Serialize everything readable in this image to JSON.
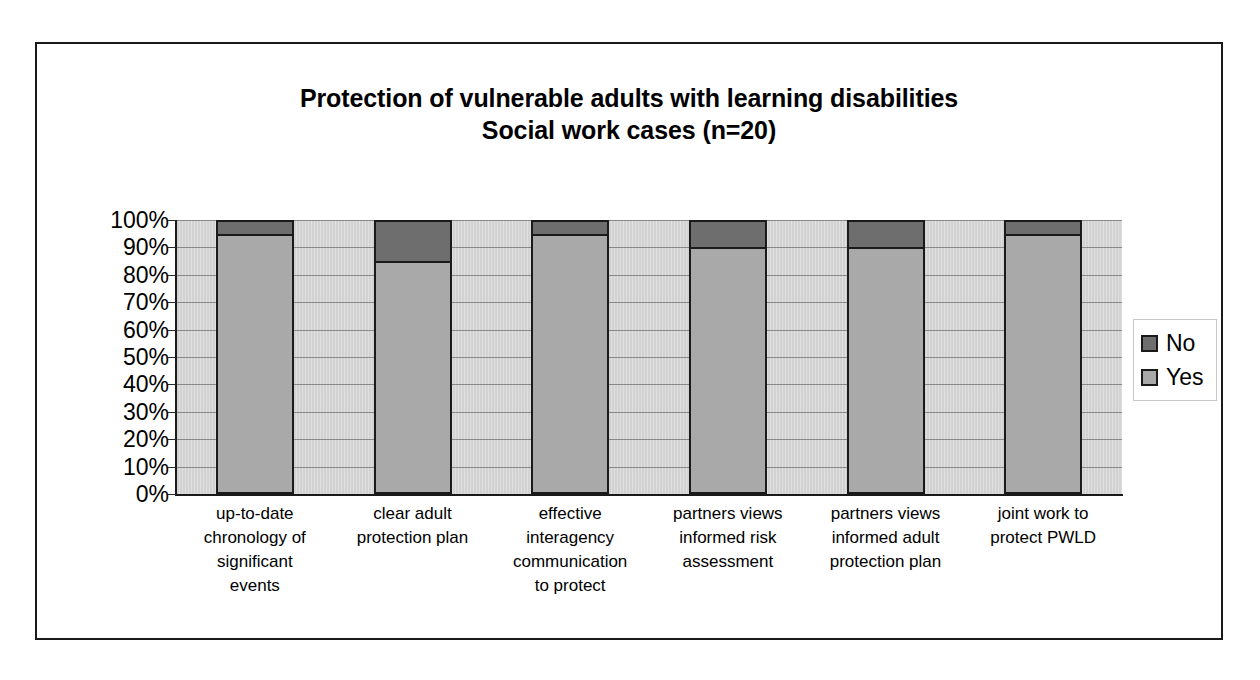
{
  "chart_data": {
    "type": "bar",
    "subtype": "100% stacked column",
    "title": "Protection of vulnerable adults with learning disabilities",
    "subtitle": "Social work cases (n=20)",
    "xlabel": "",
    "ylabel": "",
    "ylim": [
      0,
      100
    ],
    "y_tick_labels": [
      "100%",
      "90%",
      "80%",
      "70%",
      "60%",
      "50%",
      "40%",
      "30%",
      "20%",
      "10%",
      "0%"
    ],
    "y_tick_values": [
      100,
      90,
      80,
      70,
      60,
      50,
      40,
      30,
      20,
      10,
      0
    ],
    "grid": true,
    "legend_position": "right",
    "categories": [
      "up-to-date chronology of significant events",
      "clear adult protection plan",
      "effective interagency communication to protect",
      "partners views informed risk assessment",
      "partners views informed adult protection plan",
      "joint work to protect PWLD"
    ],
    "category_lines": [
      [
        "up-to-date",
        "chronology of",
        "significant",
        "events"
      ],
      [
        "clear adult",
        "protection plan"
      ],
      [
        "effective",
        "interagency",
        "communication",
        "to protect"
      ],
      [
        "partners views",
        "informed risk",
        "assessment"
      ],
      [
        "partners views",
        "informed adult",
        "protection plan"
      ],
      [
        "joint work to",
        "protect PWLD"
      ]
    ],
    "series": [
      {
        "name": "No",
        "color": "#6e6e6e",
        "values": [
          5,
          15,
          5,
          10,
          10,
          5
        ]
      },
      {
        "name": "Yes",
        "color": "#a9a9a9",
        "values": [
          95,
          85,
          95,
          90,
          90,
          95
        ]
      }
    ],
    "stack_order_top_to_bottom": [
      "No",
      "Yes"
    ]
  },
  "legend": {
    "items": [
      {
        "label": "No",
        "swatch": "no"
      },
      {
        "label": "Yes",
        "swatch": "yes"
      }
    ]
  },
  "colors": {
    "plot_background": "#d2d2d2",
    "gridline": "#6f6f6f",
    "axis": "#1a1a1a",
    "frame_border": "#1a1a1a",
    "series_no": "#6e6e6e",
    "series_yes": "#a9a9a9"
  }
}
